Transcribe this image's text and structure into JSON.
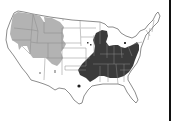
{
  "map": {
    "title": "",
    "subject": "United States distribution map",
    "colors": {
      "background": "#ffffff",
      "state_border": "#8a8a8a",
      "outline": "#6e6e6e",
      "western_range": "#b3b3b3",
      "eastern_range": "#3a3a3a",
      "right_edge_line": "#111111"
    },
    "regions": [
      {
        "name": "western-range",
        "shade": "light gray",
        "area": "Pacific Northwest, northern Rockies, Great Basin and central plains"
      },
      {
        "name": "eastern-range",
        "shade": "dark gray",
        "area": "Midwest, Ohio Valley, Appalachians and mid-South"
      }
    ],
    "isolated_points": [
      {
        "name": "texas-point",
        "shade": "dark",
        "x": 79,
        "y": 86
      },
      {
        "name": "arizona-point",
        "shade": "light",
        "x": 40,
        "y": 73
      },
      {
        "name": "new-mexico-point",
        "shade": "light",
        "x": 55,
        "y": 72
      },
      {
        "name": "iowa-point-1",
        "shade": "dark",
        "x": 88,
        "y": 43
      },
      {
        "name": "iowa-point-2",
        "shade": "dark",
        "x": 91,
        "y": 45
      },
      {
        "name": "michigan-point",
        "shade": "dark",
        "x": 125,
        "y": 43
      }
    ]
  }
}
